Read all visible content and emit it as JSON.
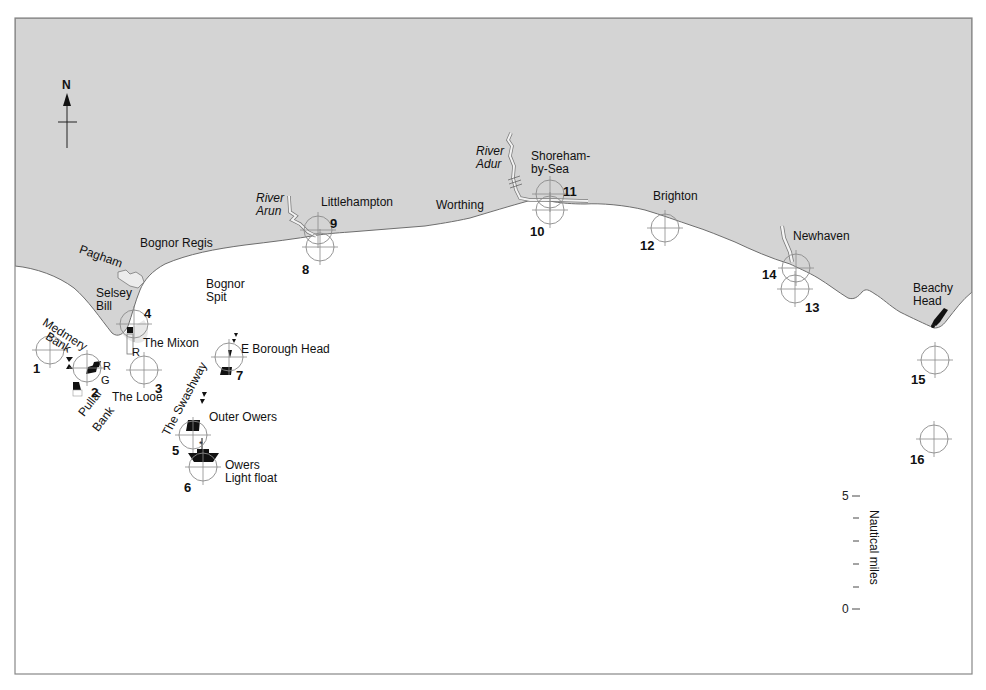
{
  "map": {
    "title": "Sussex coast waypoints: Selsey Bill to Beachy Head",
    "colors": {
      "land": "#d4d4d4",
      "sea": "#ffffff",
      "coastline": "#6e6e6e",
      "waypoint_ring": "#8a8a8a",
      "frame": "#888888",
      "text": "#111111"
    },
    "compass": {
      "label": "N",
      "icon": "north-arrow-icon"
    },
    "places": [
      {
        "name": "Bognor Regis",
        "x": 140,
        "y": 237
      },
      {
        "name": "Pagham",
        "x": 82,
        "y": 243,
        "rotate": 20
      },
      {
        "name": "Selsey",
        "x": 96,
        "y": 287
      },
      {
        "name": "Bill",
        "x": 96,
        "y": 300
      },
      {
        "name": "Littlehampton",
        "x": 321,
        "y": 196
      },
      {
        "name": "Worthing",
        "x": 436,
        "y": 199
      },
      {
        "name": "Shoreham-",
        "x": 531,
        "y": 150
      },
      {
        "name": "by-Sea",
        "x": 531,
        "y": 163
      },
      {
        "name": "Brighton",
        "x": 653,
        "y": 190
      },
      {
        "name": "Newhaven",
        "x": 793,
        "y": 230
      },
      {
        "name": "Beachy",
        "x": 913,
        "y": 282
      },
      {
        "name": "Head",
        "x": 913,
        "y": 295
      }
    ],
    "rivers": [
      {
        "name": "River",
        "x": 256,
        "y": 192
      },
      {
        "name": "Arun",
        "x": 256,
        "y": 205
      },
      {
        "name": "River",
        "x": 476,
        "y": 145
      },
      {
        "name": "Adur",
        "x": 476,
        "y": 158
      }
    ],
    "features": [
      {
        "name": "Bognor",
        "x": 206,
        "y": 278
      },
      {
        "name": "Spit",
        "x": 206,
        "y": 291
      },
      {
        "name": "The Mixon",
        "x": 143,
        "y": 337
      },
      {
        "name": "The Looe",
        "x": 112,
        "y": 391
      },
      {
        "name": "E Borough Head",
        "x": 241,
        "y": 343
      },
      {
        "name": "Outer Owers",
        "x": 209,
        "y": 411
      },
      {
        "name": "Owers",
        "x": 225,
        "y": 459
      },
      {
        "name": "Light float",
        "x": 225,
        "y": 472
      },
      {
        "name": "R",
        "x": 132,
        "y": 346
      },
      {
        "name": "R",
        "x": 103,
        "y": 360
      },
      {
        "name": "G",
        "x": 101,
        "y": 374
      }
    ],
    "rotated_features": [
      {
        "name": "Medmery",
        "x": 47,
        "y": 316,
        "rotate": 32
      },
      {
        "name": "Bank",
        "x": 50,
        "y": 330,
        "rotate": 32
      },
      {
        "name": "Pullar",
        "x": 76,
        "y": 411,
        "rotate": -52
      },
      {
        "name": "Bank",
        "x": 90,
        "y": 426,
        "rotate": -52
      },
      {
        "name": "The Swashway",
        "x": 160,
        "y": 432,
        "rotate": -62
      }
    ],
    "waypoints": [
      {
        "id": "1",
        "cx": 50,
        "cy": 350,
        "lx": 33,
        "ly": 362
      },
      {
        "id": "2",
        "cx": 87,
        "cy": 368,
        "lx": 91,
        "ly": 386
      },
      {
        "id": "3",
        "cx": 144,
        "cy": 370,
        "lx": 155,
        "ly": 382
      },
      {
        "id": "4",
        "cx": 134,
        "cy": 324,
        "lx": 144,
        "ly": 307
      },
      {
        "id": "5",
        "cx": 193,
        "cy": 435,
        "lx": 172,
        "ly": 444
      },
      {
        "id": "6",
        "cx": 203,
        "cy": 467,
        "lx": 184,
        "ly": 481
      },
      {
        "id": "7",
        "cx": 229,
        "cy": 357,
        "lx": 236,
        "ly": 369
      },
      {
        "id": "8",
        "cx": 320,
        "cy": 247,
        "lx": 302,
        "ly": 263
      },
      {
        "id": "9",
        "cx": 318,
        "cy": 230,
        "lx": 330,
        "ly": 217
      },
      {
        "id": "10",
        "cx": 550,
        "cy": 210,
        "lx": 530,
        "ly": 225
      },
      {
        "id": "11",
        "cx": 550,
        "cy": 194,
        "lx": 563,
        "ly": 185
      },
      {
        "id": "12",
        "cx": 665,
        "cy": 228,
        "lx": 640,
        "ly": 239
      },
      {
        "id": "13",
        "cx": 795,
        "cy": 289,
        "lx": 805,
        "ly": 301
      },
      {
        "id": "14",
        "cx": 796,
        "cy": 268,
        "lx": 762,
        "ly": 268
      },
      {
        "id": "15",
        "cx": 935,
        "cy": 360,
        "lx": 911,
        "ly": 373
      },
      {
        "id": "16",
        "cx": 934,
        "cy": 439,
        "lx": 910,
        "ly": 453
      }
    ],
    "scale": {
      "label": "Nautical miles",
      "max_label": "5",
      "min_label": "0",
      "ticks": 6
    }
  }
}
